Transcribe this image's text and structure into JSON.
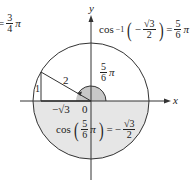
{
  "diagram": {
    "type": "unit-circle-arccos",
    "origin": {
      "x": 91,
      "y": 101
    },
    "radius": 58,
    "angle_label_radius": 15,
    "colors": {
      "stroke": "#333333",
      "lower_half_fill": "#e6e6e6",
      "angle_fill": "#c8c8c8",
      "text": "#222222"
    },
    "axes": {
      "x_label": "x",
      "y_label": "y"
    },
    "triangle": {
      "hypotenuse_label": "2",
      "opposite_label": "1",
      "adjacent_label": "−√3",
      "origin_label": "0"
    },
    "angle_label": {
      "num": "5",
      "den": "6",
      "pi": "π"
    },
    "top_left_partial": {
      "prefix": "=",
      "num": "3",
      "den": "4",
      "pi": "π"
    },
    "top_right_equation": {
      "func": "cos",
      "sup": "−1",
      "sign": "−",
      "inner_num": "√3",
      "inner_den": "2",
      "equals": "=",
      "result_num": "5",
      "result_den": "6",
      "pi": "π"
    },
    "bottom_equation": {
      "func": "cos",
      "arg_num": "5",
      "arg_den": "6",
      "pi": "π",
      "equals": "=",
      "sign": "−",
      "result_num": "√3",
      "result_den": "2"
    }
  }
}
